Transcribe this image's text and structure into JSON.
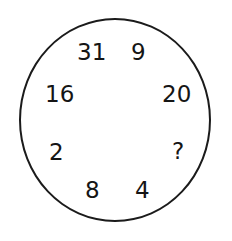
{
  "figure": {
    "type": "number-puzzle-circle",
    "shape_label": "circle",
    "outline_color": "#1b1b1b",
    "text_color": "#151515",
    "background_color": "#ffffff",
    "numbers": [
      {
        "value": "31",
        "position": "top-left"
      },
      {
        "value": "9",
        "position": "top-right"
      },
      {
        "value": "16",
        "position": "left-upper"
      },
      {
        "value": "20",
        "position": "right-upper"
      },
      {
        "value": "2",
        "position": "left-lower"
      },
      {
        "value": "?",
        "position": "right-lower"
      },
      {
        "value": "8",
        "position": "bottom-left"
      },
      {
        "value": "4",
        "position": "bottom-right"
      }
    ]
  }
}
